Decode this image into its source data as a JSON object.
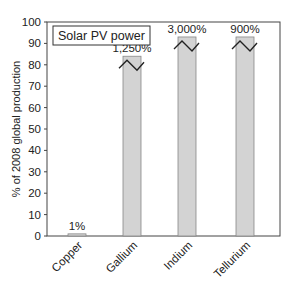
{
  "chart_data": {
    "type": "bar",
    "title": "Solar PV power",
    "xlabel": "",
    "ylabel": "% of 2008 global production",
    "ylim": [
      0,
      100
    ],
    "yticks": [
      0,
      10,
      20,
      30,
      40,
      50,
      60,
      70,
      80,
      90,
      100
    ],
    "grid": false,
    "categories": [
      "Copper",
      "Gallium",
      "Indium",
      "Tellurium"
    ],
    "values": [
      1,
      1250,
      3000,
      900
    ],
    "data_labels": [
      "1%",
      "1,250%",
      "3,000%",
      "900%"
    ],
    "axis_break": [
      false,
      true,
      true,
      true
    ],
    "bar_color": "#d3d3d3",
    "bar_edge_color": "#888888"
  }
}
